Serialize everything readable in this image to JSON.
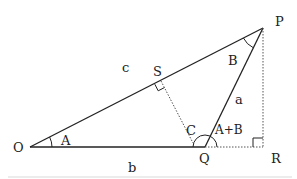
{
  "diagram": {
    "type": "geometry-triangle",
    "points": {
      "O": {
        "label": "O",
        "x": 30,
        "y": 147
      },
      "Q": {
        "label": "Q",
        "x": 205,
        "y": 147
      },
      "R": {
        "label": "R",
        "x": 263,
        "y": 147
      },
      "P": {
        "label": "P",
        "x": 263,
        "y": 28
      },
      "S": {
        "label": "S",
        "x": 161,
        "y": 81
      }
    },
    "sides": {
      "c": "c",
      "a": "a",
      "b": "b"
    },
    "angles": {
      "A": "A",
      "B": "B",
      "C": "C",
      "AB": "A+B"
    },
    "colors": {
      "stroke": "#222222",
      "dotted": "#555555",
      "baseline": "#e4e4e4"
    }
  }
}
